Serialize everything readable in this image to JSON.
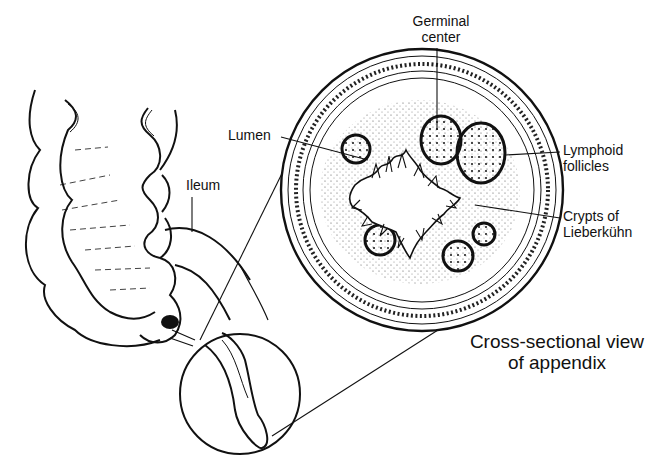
{
  "figure": {
    "type": "anatomical-illustration",
    "colors": {
      "ink": "#111111",
      "background": "#ffffff",
      "stipple": "#555555"
    }
  },
  "labels": {
    "germinal_center": {
      "line1": "Germinal",
      "line2": "center"
    },
    "lumen": "Lumen",
    "lymphoid_follicles": {
      "line1": "Lymphoid",
      "line2": "follicles"
    },
    "crypts": {
      "line1": "Crypts of",
      "line2": "Lieberkühn"
    },
    "ileum": "Ileum",
    "caption": {
      "line1": "Cross-sectional view",
      "line2": "of appendix"
    }
  }
}
